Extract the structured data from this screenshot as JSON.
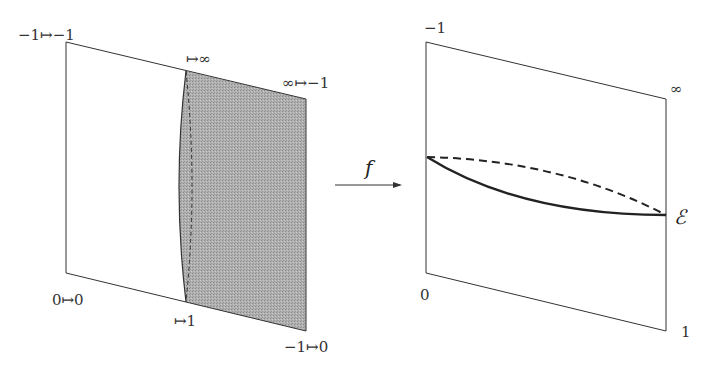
{
  "left_panel": {
    "labels": {
      "top_left": "−1↦−1",
      "top_mid": "↦∞",
      "top_right": "∞↦−1",
      "bottom_left": "0↦0",
      "bottom_mid": "↦1",
      "bottom_right": "−1↦0"
    },
    "shade_color": "#a8a8a8"
  },
  "arrow": {
    "label": "f"
  },
  "right_panel": {
    "labels": {
      "top_left": "−1",
      "top_right": "∞",
      "bottom_left": "0",
      "bottom_right": "1",
      "curve_endpoint": "ℰ"
    }
  }
}
